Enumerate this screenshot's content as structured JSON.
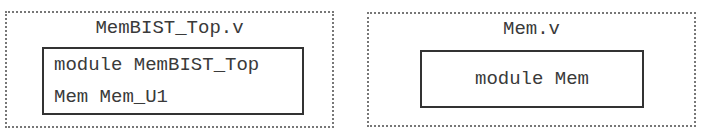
{
  "files": [
    {
      "name": "MemBIST_Top.v",
      "module_lines": [
        "module MemBIST_Top",
        "Mem Mem_U1"
      ]
    },
    {
      "name": "Mem.v",
      "module_lines": [
        "module Mem"
      ]
    }
  ]
}
